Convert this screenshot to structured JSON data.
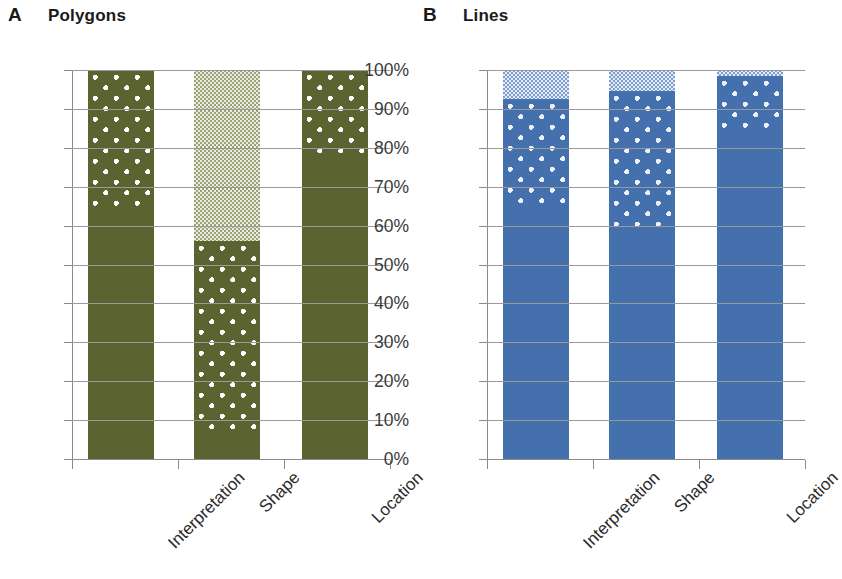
{
  "figure": {
    "panels": [
      {
        "letter": "A",
        "title": "Polygons",
        "color": "#5b6431",
        "light_color": "#e9ecdf"
      },
      {
        "letter": "B",
        "title": "Lines",
        "color": "#4470ad",
        "light_color": "#e3ebf7"
      }
    ]
  },
  "axis": {
    "y_ticks": [
      "100%",
      "90%",
      "80%",
      "70%",
      "60%",
      "50%",
      "40%",
      "30%",
      "20%",
      "10%",
      "0%"
    ],
    "y_values": [
      100,
      90,
      80,
      70,
      60,
      50,
      40,
      30,
      20,
      10,
      0
    ],
    "x_categories": [
      "Interpretation",
      "Shape",
      "Location"
    ]
  },
  "chart_data": [
    {
      "type": "bar",
      "subtype": "stacked-percentage",
      "title": "Polygons",
      "panel_letter": "A",
      "xlabel": "",
      "ylabel": "",
      "ylim": [
        0,
        100
      ],
      "yticks": [
        0,
        10,
        20,
        30,
        40,
        50,
        60,
        70,
        80,
        90,
        100
      ],
      "ytick_labels": [
        "0%",
        "10%",
        "20%",
        "30%",
        "40%",
        "50%",
        "60%",
        "70%",
        "80%",
        "90%",
        "100%"
      ],
      "grid": true,
      "legend": "none",
      "color": "#5b6431",
      "categories": [
        "Interpretation",
        "Shape",
        "Location"
      ],
      "series": [
        {
          "name": "solid",
          "pattern": "solid",
          "values": [
            64,
            7,
            78
          ]
        },
        {
          "name": "dotted",
          "pattern": "dots",
          "values": [
            36,
            49,
            22
          ]
        },
        {
          "name": "checkered",
          "pattern": "fine-checker",
          "values": [
            0,
            44,
            0
          ]
        }
      ]
    },
    {
      "type": "bar",
      "subtype": "stacked-percentage",
      "title": "Lines",
      "panel_letter": "B",
      "xlabel": "",
      "ylabel": "",
      "ylim": [
        0,
        100
      ],
      "yticks": [
        0,
        10,
        20,
        30,
        40,
        50,
        60,
        70,
        80,
        90,
        100
      ],
      "ytick_labels": [
        "0%",
        "10%",
        "20%",
        "30%",
        "40%",
        "50%",
        "60%",
        "70%",
        "80%",
        "90%",
        "100%"
      ],
      "grid": true,
      "legend": "none",
      "color": "#4470ad",
      "categories": [
        "Interpretation",
        "Shape",
        "Location"
      ],
      "series": [
        {
          "name": "solid",
          "pattern": "solid",
          "values": [
            65,
            59,
            84
          ]
        },
        {
          "name": "dotted",
          "pattern": "dots",
          "values": [
            27.5,
            35.5,
            14.5
          ]
        },
        {
          "name": "checkered",
          "pattern": "fine-checker",
          "values": [
            7.5,
            5.5,
            1.5
          ]
        }
      ]
    }
  ]
}
